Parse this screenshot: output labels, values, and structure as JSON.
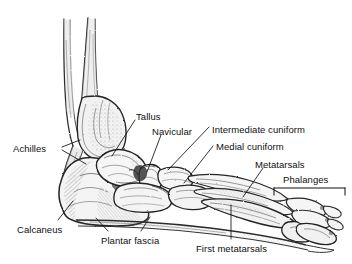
{
  "diagram": {
    "background_color": "#ffffff",
    "ink_color": "#1a1a1a",
    "label_color": "#101010",
    "style": "pencil-sketch-anatomical-illustration"
  },
  "labels": [
    {
      "id": "achilles",
      "text": "Achilles",
      "x": 13,
      "y": 143
    },
    {
      "id": "tallus",
      "text": "Tallus",
      "x": 136,
      "y": 111
    },
    {
      "id": "navicular",
      "text": "Navicular",
      "x": 152,
      "y": 126
    },
    {
      "id": "intermediate-cuniform",
      "text": "Intermediate cuniform",
      "x": 212,
      "y": 124
    },
    {
      "id": "medial-cuniform",
      "text": "Medial cuniform",
      "x": 216,
      "y": 141
    },
    {
      "id": "metatarsals",
      "text": "Metatarsals",
      "x": 255,
      "y": 159
    },
    {
      "id": "phalanges",
      "text": "Phalanges",
      "x": 283,
      "y": 174
    },
    {
      "id": "calcaneus",
      "text": "Calcaneus",
      "x": 17,
      "y": 224
    },
    {
      "id": "plantar-fascia",
      "text": "Plantar fascia",
      "x": 101,
      "y": 235
    },
    {
      "id": "first-metatarsals",
      "text": "First metatarsals",
      "x": 196,
      "y": 243
    }
  ],
  "leader_lines": [
    {
      "id": "achilles-leader",
      "from": "achilles",
      "points": "62,147 78,140"
    },
    {
      "id": "achilles-leader-2",
      "from": "achilles",
      "points": "62,150 86,163"
    },
    {
      "id": "tallus-leader",
      "from": "tallus",
      "points": "135,121 112,156"
    },
    {
      "id": "navicular-leader",
      "from": "navicular",
      "points": "160,136 146,172"
    },
    {
      "id": "intermediate-cuniform-leader",
      "from": "intermediate-cuniform",
      "points": "209,126 168,168"
    },
    {
      "id": "medial-cuniform-leader",
      "from": "medial-cuniform",
      "points": "213,145 182,182"
    },
    {
      "id": "metatarsals-leader",
      "from": "metatarsals",
      "points": "262,168 243,196"
    },
    {
      "id": "calcaneus-leader",
      "from": "calcaneus",
      "points": "58,221 72,202"
    },
    {
      "id": "plantar-fascia-leader-1",
      "from": "plantar-fascia",
      "points": "107,232 95,218"
    },
    {
      "id": "plantar-fascia-leader-2",
      "from": "plantar-fascia",
      "points": "140,232 148,217"
    },
    {
      "id": "first-metatarsals-leader",
      "from": "first-metatarsals",
      "points": "231,239 231,206"
    }
  ],
  "bracket": {
    "id": "phalanges-bracket",
    "label_ref": "phalanges",
    "x1": 274,
    "x2": 345,
    "y": 188,
    "tick_height": 7
  },
  "bones": [
    {
      "id": "tibia",
      "name": "Tibia",
      "visible": true
    },
    {
      "id": "fibula",
      "name": "Fibula",
      "visible": true
    },
    {
      "id": "talus",
      "name": "Talus",
      "visible": true
    },
    {
      "id": "calcaneus-bone",
      "name": "Calcaneus",
      "visible": true
    },
    {
      "id": "navicular-bone",
      "name": "Navicular",
      "visible": true
    },
    {
      "id": "cuboid",
      "name": "Cuboid",
      "visible": true
    },
    {
      "id": "cuneiforms",
      "name": "Cuneiforms",
      "visible": true
    },
    {
      "id": "metatarsals-bone",
      "name": "Metatarsals",
      "visible": true
    },
    {
      "id": "phalanges-bone",
      "name": "Phalanges",
      "visible": true
    }
  ],
  "soft_tissue": [
    {
      "id": "achilles-tendon",
      "name": "Achilles tendon",
      "visible": true
    },
    {
      "id": "plantar-fascia-band",
      "name": "Plantar fascia",
      "visible": true
    }
  ]
}
